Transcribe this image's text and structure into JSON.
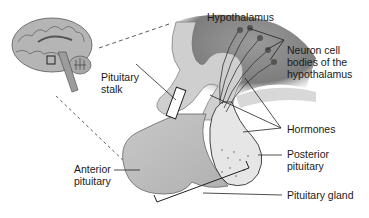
{
  "diagram": {
    "type": "anatomical-illustration",
    "labels": {
      "hypothalamus": "Hypothalamus",
      "neuron_line1": "Neuron cell",
      "neuron_line2": "bodies of the",
      "neuron_line3": "hypothalamus",
      "stalk_line1": "Pituitary",
      "stalk_line2": "stalk",
      "hormones": "Hormones",
      "posterior_line1": "Posterior",
      "posterior_line2": "pituitary",
      "anterior_line1": "Anterior",
      "anterior_line2": "pituitary",
      "gland": "Pituitary gland"
    },
    "colors": {
      "tissue_dark": "#8a8a8a",
      "tissue_mid": "#b8b8b8",
      "tissue_light": "#d4d4d4",
      "posterior": "#e6e6e6",
      "line": "#222222"
    }
  }
}
